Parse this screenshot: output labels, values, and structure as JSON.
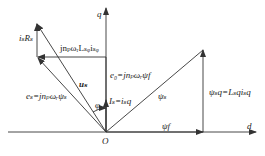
{
  "diagram": {
    "type": "phasor-diagram",
    "axes": {
      "d": "d",
      "q": "q",
      "origin": "O"
    },
    "labels": {
      "isRs": "iₛRₛ",
      "jLsq": "jnₚωᵣLₛᵩiₛᵩ",
      "us": "uₛ",
      "es": "eₛ=jnₚωᵣψₛ",
      "e0": "e₀=jnₚωᵣψf",
      "phi": "φ",
      "Is": "Iₛ=iₛq",
      "psis": "ψₛ",
      "psisq": "ψₛq=Lₛqiₛq",
      "psif": "ψf"
    },
    "color": "#333333"
  }
}
